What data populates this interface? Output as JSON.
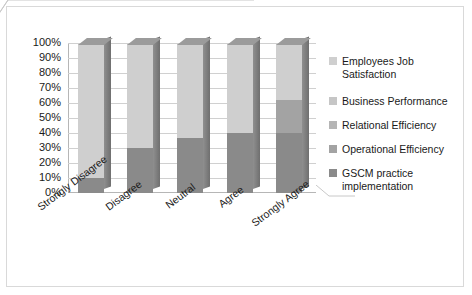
{
  "chart_data": {
    "type": "bar",
    "subtype": "stacked-100-percent-3d",
    "title": "",
    "xlabel": "",
    "ylabel": "",
    "ylim": [
      0,
      100
    ],
    "ytick_labels": [
      "100%",
      "90%",
      "80%",
      "70%",
      "60%",
      "50%",
      "40%",
      "30%",
      "20%",
      "10%",
      "0%"
    ],
    "ytick_values": [
      100,
      90,
      80,
      70,
      60,
      50,
      40,
      30,
      20,
      10,
      0
    ],
    "grid": true,
    "legend_position": "right",
    "categories": [
      "Strongly Disagree",
      "Disagree",
      "Neutral",
      "Agree",
      "Strongly Agree"
    ],
    "series": [
      {
        "name": "GSCM practice implementation",
        "color": "#8a8a8a",
        "values": [
          10,
          30,
          37,
          40,
          40
        ]
      },
      {
        "name": "Operational Efficiency",
        "color": "#a3a3a3",
        "values": [
          0,
          0,
          0,
          0,
          22
        ]
      },
      {
        "name": "Relational Efficiency",
        "color": "#b5b5b5",
        "values": [
          0,
          0,
          0,
          0,
          0
        ]
      },
      {
        "name": "Business Performance",
        "color": "#c6c6c6",
        "values": [
          0,
          0,
          0,
          0,
          0
        ]
      },
      {
        "name": "Employees Job Satisfaction",
        "color": "#cfcfcf",
        "values": [
          90,
          70,
          63,
          60,
          38
        ]
      }
    ]
  },
  "legend": {
    "items": [
      {
        "label": "Employees Job Satisfaction",
        "color": "#cfcfcf"
      },
      {
        "label": "Business Performance",
        "color": "#c6c6c6"
      },
      {
        "label": "Relational Efficiency",
        "color": "#b5b5b5"
      },
      {
        "label": "Operational Efficiency",
        "color": "#a3a3a3"
      },
      {
        "label": "GSCM practice implementation",
        "color": "#8a8a8a"
      }
    ]
  },
  "style": {
    "border_color": "#d9d9d9",
    "grid_color": "#d0d0d0",
    "axis_color": "#b6b6b6",
    "text_color": "#1a1a1a",
    "plot_background": "#ffffff"
  }
}
